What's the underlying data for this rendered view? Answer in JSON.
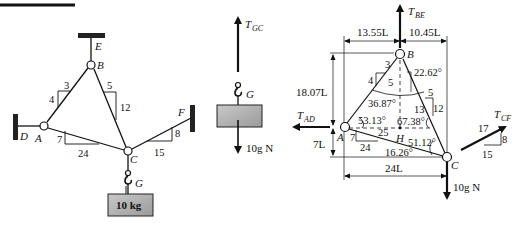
{
  "figure": {
    "top_rule": true,
    "left_diagram": {
      "points": {
        "E": {
          "label": "E"
        },
        "B": {
          "label": "B"
        },
        "A": {
          "label": "A"
        },
        "D": {
          "label": "D"
        },
        "C": {
          "label": "C"
        },
        "F": {
          "label": "F"
        },
        "G": {
          "label": "G"
        }
      },
      "slopes": {
        "AB": {
          "rise": "4",
          "run": "3"
        },
        "BC": {
          "run": "5",
          "rise": "12"
        },
        "AC": {
          "rise": "7",
          "run": "24"
        },
        "CF": {
          "rise": "8",
          "run": "15"
        }
      },
      "mass_label": "10 kg"
    },
    "middle_fbd": {
      "tension_label": "T",
      "tension_sub": "GC",
      "hook_label": "G",
      "weight_label": "10g N"
    },
    "right_fbd": {
      "points": {
        "B": "B",
        "A": "A",
        "C": "C",
        "H": "H"
      },
      "forces": {
        "T_BE": {
          "main": "T",
          "sub": "BE"
        },
        "T_AD": {
          "main": "T",
          "sub": "AD"
        },
        "T_CF": {
          "main": "T",
          "sub": "CF"
        },
        "weight": "10g N"
      },
      "dimensions": {
        "left_top": "13.55L",
        "right_top": "10.45L",
        "height_B": "18.07L",
        "height_A": "7L",
        "width_AC": "24L"
      },
      "angles": {
        "a1": "22.62°",
        "a2": "36.87°",
        "a3": "53.13°",
        "a4": "67.38°",
        "a5": "51.12°",
        "a6": "16.26°"
      },
      "triangle_AB": {
        "a": "3",
        "b": "4",
        "h": "5"
      },
      "triangle_BC": {
        "a": "5",
        "b": "12",
        "h": "13"
      },
      "triangle_AC": {
        "a": "7",
        "b": "24",
        "h": "25"
      },
      "triangle_CF": {
        "a": "8",
        "b": "15",
        "h": "17"
      }
    }
  }
}
